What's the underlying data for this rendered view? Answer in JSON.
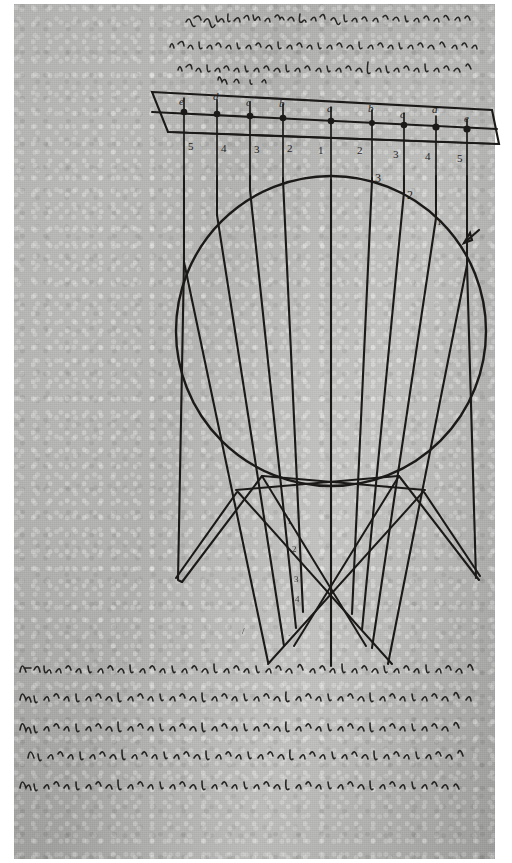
{
  "document": {
    "kind": "manuscript-page",
    "title": "Manuscript folio with spherical refraction diagram",
    "ink_color": "#1c1a18",
    "paper_color": "#b9b9b7",
    "border_color": "#ffffff"
  },
  "header_note": {
    "label": "handwritten-latin-note-above-diagram",
    "legible": false,
    "lines": [
      "vicem bis dubia radij egredientes coniunctae",
      "in in convexum superficiem sphera refractio",
      "Tab. a."
    ]
  },
  "diagram": {
    "name": "spherical-refraction-caustic-diagram",
    "circle": {
      "cx": 331,
      "cy": 331,
      "r": 155,
      "label": "sphere-outline"
    },
    "band": {
      "label": "incident-wavefront-band",
      "outline": [
        [
          152,
          92
        ],
        [
          492,
          110
        ],
        [
          499,
          144
        ],
        [
          168,
          132
        ]
      ],
      "inner_line_left": [
        152,
        112
      ],
      "inner_line_right": [
        497,
        129
      ]
    },
    "top_point_labels": [
      "e",
      "d",
      "c",
      "b",
      "a",
      "b",
      "c",
      "d",
      "e"
    ],
    "top_number_labels_left": [
      "5",
      "4",
      "3",
      "2"
    ],
    "top_number_labels_right": [
      "2",
      "3",
      "4",
      "5"
    ],
    "top_number_center": "1",
    "interior_labels": [
      "3",
      "2",
      "1"
    ],
    "axis_labels_below": [
      "1",
      "2",
      "3",
      "4"
    ],
    "marker": {
      "name": "arrow-marker",
      "x": 470,
      "y": 236,
      "points_to": "ray-crossing-at-sphere-edge"
    },
    "ray_count": 9,
    "caustic_focus": {
      "x": 303,
      "y": 540
    }
  },
  "caption": {
    "label": "handwritten-latin-caption-below-diagram",
    "legible": false,
    "lines": [
      "A hoc huius convexi ipsorum refractionum earundem ad terminum",
      "habebis instrumenta: semel nulla quam inquiritur haec praecis.",
      "Docet ipsius mensura sphaerica convexitas igitur in praesentia",
      "intelligi illorum deducimus in initio. Alterum, cum praemissis",
      "perspicuis salva instrumenta in haec demonstrationem proxima."
    ]
  }
}
